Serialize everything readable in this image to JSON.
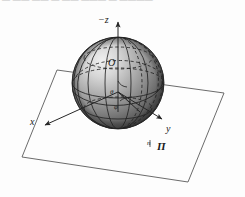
{
  "figure": {
    "top_clipped_text": "— —— —— — —— ——— — ————",
    "labels": {
      "axis_z": "−z",
      "axis_x": "x",
      "axis_y": "y",
      "origin": "O",
      "angle_theta": "θ",
      "angle_phi": "φ",
      "normal": "n",
      "plane": "П"
    },
    "colors": {
      "background": "#fdfdfd",
      "ink": "#1a1a1a",
      "line": "#4a4a4a",
      "plane_edge": "#5a5a5a",
      "sphere_light": "#e8e8e8",
      "sphere_mid": "#9a9a9a",
      "sphere_dark": "#4e4e4e",
      "sphere_shadow": "#2f2f2f",
      "grid_line": "#2a2a2a"
    },
    "geometry": {
      "sphere_center": [
        118,
        83
      ],
      "sphere_radius": 46,
      "plane_corners": [
        [
          57,
          70
        ],
        [
          224,
          93
        ],
        [
          188,
          182
        ],
        [
          22,
          157
        ]
      ],
      "z_axis_top": [
        118,
        20
      ],
      "x_axis_end": [
        44,
        126
      ],
      "y_axis_end": [
        163,
        120
      ]
    }
  }
}
